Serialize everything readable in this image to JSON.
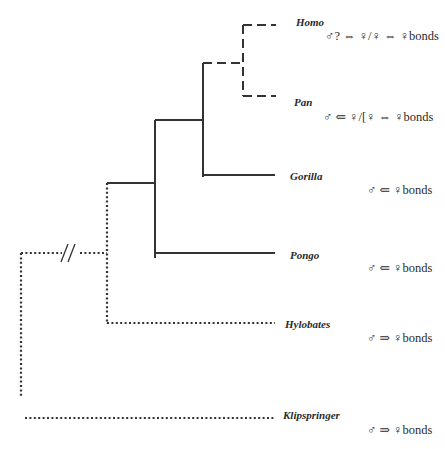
{
  "diagram": {
    "type": "phylogenetic-tree",
    "line_color": "#333333",
    "line_styles": {
      "solid": "solid",
      "dashed": "dashed",
      "dotted": "dotted"
    },
    "break_mark": "//",
    "taxa": [
      {
        "name": "Homo",
        "bonds": "♂? ⇔ ♀/♀ ⇔ ♀bonds",
        "branch_style": "dashed"
      },
      {
        "name": "Pan",
        "bonds": "♂ ⇐ ♀/[♀ ⇔ ♀bonds",
        "branch_style": "dashed"
      },
      {
        "name": "Gorilla",
        "bonds": "♂ ⇐ ♀bonds",
        "branch_style": "solid"
      },
      {
        "name": "Pongo",
        "bonds": "♂ ⇐ ♀bonds",
        "branch_style": "solid"
      },
      {
        "name": "Hylobates",
        "bonds": "♂ ⇒ ♀bonds",
        "branch_style": "dotted"
      },
      {
        "name": "Klipspringer",
        "bonds": "♂ ⇒ ♀bonds",
        "branch_style": "dotted"
      }
    ]
  }
}
